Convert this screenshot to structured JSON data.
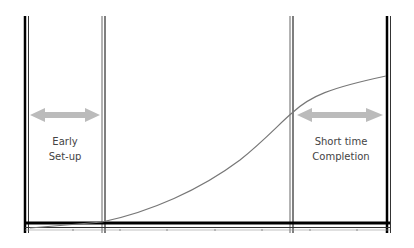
{
  "labels": {
    "left_line1": "Early",
    "left_line2": "Set-up",
    "right_line1": "Short time",
    "right_line2": "Completion"
  },
  "colors": {
    "frame": "#000000",
    "divider": "#666666",
    "curve": "#777777",
    "arrow": "#bbbbbb",
    "text": "#444444"
  }
}
